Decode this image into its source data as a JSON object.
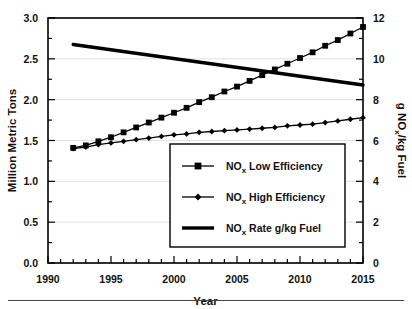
{
  "chart_data": {
    "type": "line",
    "title": "",
    "xlabel": "Year",
    "ylabel": "Million Metric Tons",
    "y2label": "g NOx/kg Fuel",
    "xlim": [
      1990,
      2015
    ],
    "ylim": [
      0.0,
      3.0
    ],
    "y2lim": [
      0,
      12
    ],
    "grid": true,
    "legend_position": "lower right",
    "x_ticks": [
      1990,
      1995,
      2000,
      2005,
      2010,
      2015
    ],
    "x_tick_labels": [
      "1990",
      "1995",
      "2000",
      "2005",
      "2010",
      "2015"
    ],
    "x_minor_step": 1,
    "y_ticks": [
      0.0,
      0.5,
      1.0,
      1.5,
      2.0,
      2.5,
      3.0
    ],
    "y_tick_labels": [
      "0.0",
      "0.5",
      "1.0",
      "1.5",
      "2.0",
      "2.5",
      "3.0"
    ],
    "y_minor_step": 0.25,
    "y2_ticks": [
      0,
      2,
      4,
      6,
      8,
      10,
      12
    ],
    "y2_tick_labels": [
      "0",
      "2",
      "4",
      "6",
      "8",
      "10",
      "12"
    ],
    "y2_minor_step": 1,
    "x": [
      1992,
      1993,
      1994,
      1995,
      1996,
      1997,
      1998,
      1999,
      2000,
      2001,
      2002,
      2003,
      2004,
      2005,
      2006,
      2007,
      2008,
      2009,
      2010,
      2011,
      2012,
      2013,
      2014,
      2015
    ],
    "series": [
      {
        "name": "NOx Low Efficiency",
        "legend_label_rich": [
          "NO",
          "x",
          " Low Efficiency"
        ],
        "marker": "square",
        "axis": "left",
        "values": [
          1.41,
          1.44,
          1.49,
          1.54,
          1.6,
          1.66,
          1.72,
          1.78,
          1.84,
          1.9,
          1.97,
          2.03,
          2.1,
          2.16,
          2.23,
          2.3,
          2.37,
          2.44,
          2.51,
          2.58,
          2.66,
          2.73,
          2.81,
          2.89
        ]
      },
      {
        "name": "NOx High Efficiency",
        "legend_label_rich": [
          "NO",
          "x",
          " High Efficiency"
        ],
        "marker": "diamond",
        "axis": "left",
        "values": [
          1.4,
          1.42,
          1.45,
          1.47,
          1.49,
          1.51,
          1.53,
          1.55,
          1.57,
          1.58,
          1.6,
          1.61,
          1.62,
          1.63,
          1.64,
          1.65,
          1.66,
          1.68,
          1.69,
          1.7,
          1.72,
          1.74,
          1.76,
          1.78
        ]
      },
      {
        "name": "NOx Rate g/kg Fuel",
        "legend_label_rich": [
          "NO",
          "x",
          " Rate  g/kg Fuel"
        ],
        "marker": "none",
        "axis": "right",
        "x": [
          1992,
          2015
        ],
        "values": [
          10.7,
          8.72
        ]
      }
    ],
    "colors": {
      "line": "#000000",
      "grid": "#d9d9d9",
      "frame": "#000000"
    }
  },
  "legend": {
    "items": [
      {
        "label_main": "NO",
        "label_sub": "x",
        "label_rest": " Low Efficiency",
        "marker": "square"
      },
      {
        "label_main": "NO",
        "label_sub": "x",
        "label_rest": " High Efficiency",
        "marker": "diamond"
      },
      {
        "label_main": "NO",
        "label_sub": "x",
        "label_rest": " Rate  g/kg Fuel",
        "marker": "thickline"
      }
    ]
  },
  "axes": {
    "x_title": "Year",
    "y_left_title": "Million Metric Tons",
    "y_right_title_main": "g NO",
    "y_right_title_sub": "x",
    "y_right_title_rest": "/kg Fuel"
  }
}
